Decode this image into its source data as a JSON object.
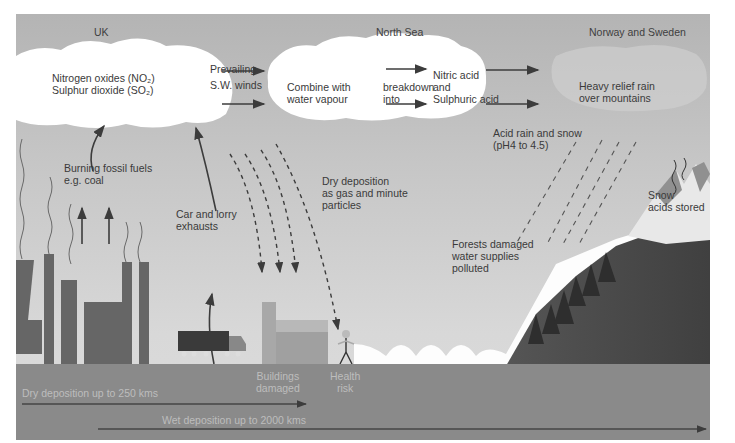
{
  "diagram": {
    "regions": [
      "UK",
      "North Sea",
      "Norway and Sweden"
    ],
    "clouds": {
      "uk_cloud": [
        "Nitrogen oxides (NO₂)",
        "Sulphur dioxide (SO₂)"
      ],
      "sea_cloud": {
        "left": [
          "Combine with",
          "water vapour"
        ],
        "middle": [
          "breakdown",
          "into"
        ],
        "right": [
          "Nitric acid",
          "and",
          "Sulphuric acid"
        ]
      },
      "norway_cloud": [
        "Heavy relief rain",
        "over mountains"
      ]
    },
    "labels": {
      "winds": [
        "Prevailing",
        "S.W. winds"
      ],
      "fossil_fuels": [
        "Burning fossil fuels",
        "e.g. coal"
      ],
      "exhausts": [
        "Car and lorry",
        "exhausts"
      ],
      "dry_deposition": [
        "Dry deposition",
        "as gas and minute",
        "particles"
      ],
      "acid_rain": [
        "Acid rain and snow",
        "(pH4 to 4.5)"
      ],
      "snow": [
        "Snow",
        "acids stored"
      ],
      "forests": [
        "Forests damaged",
        "water supplies",
        "polluted"
      ],
      "buildings": [
        "Buildings",
        "damaged"
      ],
      "health": [
        "Health",
        "risk"
      ]
    },
    "distance_scales": [
      {
        "label": "Dry deposition up to 250 kms"
      },
      {
        "label": "Wet deposition up to 2000 kms"
      }
    ],
    "colors": {
      "sky_top": "#b4b4b4",
      "sky_bottom": "#dcdcdc",
      "cloud": "#ffffff",
      "factory": "#666666",
      "ground": "#8a8a8a",
      "mountain": "#4a4a4a",
      "arrow": "#3c3c3c"
    }
  }
}
